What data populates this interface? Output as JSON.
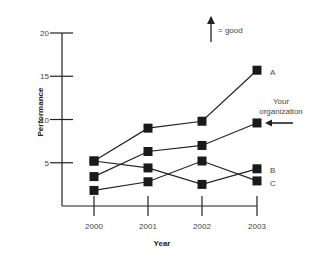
{
  "chart_data": {
    "type": "line",
    "title": "",
    "xlabel": "Year",
    "ylabel": "Performance",
    "x": [
      "2000",
      "2001",
      "2002",
      "2003"
    ],
    "yticks": [
      "5",
      "10",
      "15",
      "20"
    ],
    "ylim": [
      0,
      20
    ],
    "grid": false,
    "legend": "inline labels at right end of lines",
    "marker": "square",
    "series": [
      {
        "name": "A",
        "values": [
          5.2,
          9.0,
          9.8,
          15.7
        ]
      },
      {
        "name": "Your organization",
        "values": [
          3.4,
          6.3,
          7.0,
          9.6
        ]
      },
      {
        "name": "B",
        "values": [
          5.2,
          4.4,
          2.5,
          4.3
        ]
      },
      {
        "name": "C",
        "values": [
          1.8,
          2.8,
          5.2,
          2.9
        ]
      }
    ],
    "annotations": [
      {
        "text": "= good",
        "icon": "up-arrow-icon",
        "meaning": "up arrow = good"
      },
      {
        "text": "Your organization",
        "icon": "left-arrow-icon"
      }
    ]
  },
  "labels": {
    "good": "= good",
    "your_line1": "Your",
    "your_line2": "organization",
    "A": "A",
    "B": "B",
    "C": "C"
  }
}
